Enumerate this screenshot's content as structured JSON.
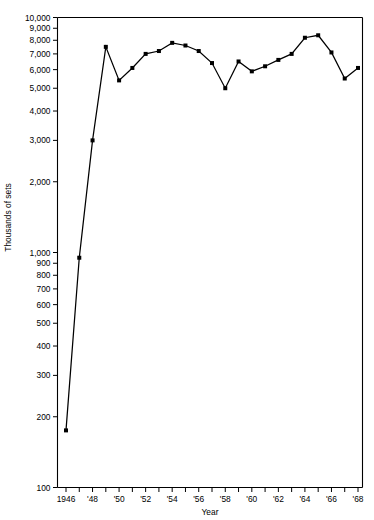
{
  "chart_data": {
    "type": "line",
    "title": "",
    "xlabel": "Year",
    "ylabel": "Thousands of sets",
    "yscale": "log",
    "ylim": [
      100,
      10000
    ],
    "xlim": [
      1946,
      1968
    ],
    "grid": false,
    "legend": "none",
    "marker": "filled-square",
    "line_color": "#000000",
    "x": [
      1946,
      1947,
      1948,
      1949,
      1950,
      1951,
      1952,
      1953,
      1954,
      1955,
      1956,
      1957,
      1958,
      1959,
      1960,
      1961,
      1962,
      1963,
      1964,
      1965,
      1966,
      1967,
      1968
    ],
    "values": [
      175,
      950,
      3000,
      7500,
      5400,
      6100,
      7000,
      7200,
      7800,
      7600,
      7200,
      6400,
      5000,
      6500,
      5900,
      6200,
      6600,
      7000,
      8200,
      8400,
      7100,
      5500,
      6100
    ],
    "x_tick_labels": [
      "1946",
      "",
      "'48",
      "",
      "'50",
      "",
      "'52",
      "",
      "'54",
      "",
      "'56",
      "",
      "'58",
      "",
      "'60",
      "",
      "'62",
      "",
      "'64",
      "",
      "'66",
      "",
      "'68"
    ],
    "y_tick_labels": [
      "100",
      "200",
      "300",
      "400",
      "500",
      "600",
      "700",
      "800",
      "900",
      "1,000",
      "2,000",
      "3,000",
      "4,000",
      "5,000",
      "6,000",
      "7,000",
      "8,000",
      "9,000",
      "10,000"
    ],
    "y_tick_values": [
      100,
      200,
      300,
      400,
      500,
      600,
      700,
      800,
      900,
      1000,
      2000,
      3000,
      4000,
      5000,
      6000,
      7000,
      8000,
      9000,
      10000
    ]
  }
}
